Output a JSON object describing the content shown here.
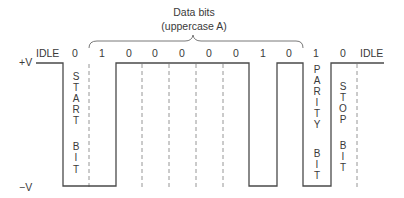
{
  "diagram": {
    "title": "Data bits",
    "subtitle": "(uppercase A)",
    "voltage_high_label": "+V",
    "voltage_low_label": "−V",
    "idle_left_label": "IDLE",
    "idle_right_label": "IDLE",
    "bit_values": [
      {
        "role": "start",
        "value": "0"
      },
      {
        "role": "data",
        "value": "1"
      },
      {
        "role": "data",
        "value": "0"
      },
      {
        "role": "data",
        "value": "0"
      },
      {
        "role": "data",
        "value": "0"
      },
      {
        "role": "data",
        "value": "0"
      },
      {
        "role": "data",
        "value": "0"
      },
      {
        "role": "data",
        "value": "1"
      },
      {
        "role": "data",
        "value": "0"
      },
      {
        "role": "parity",
        "value": "1"
      },
      {
        "role": "stop",
        "value": "0"
      }
    ],
    "start_bit_label": {
      "word1": [
        "S",
        "T",
        "A",
        "R",
        "T"
      ],
      "word2": [
        "B",
        "I",
        "T"
      ]
    },
    "parity_bit_label": {
      "word1": [
        "P",
        "A",
        "R",
        "I",
        "T",
        "Y"
      ],
      "word2": [
        "B",
        "I",
        "T"
      ]
    },
    "stop_bit_label": {
      "word1": [
        "S",
        "T",
        "O",
        "P"
      ],
      "word2": [
        "B",
        "I",
        "T"
      ]
    },
    "colors": {
      "line": "#4a4a4a",
      "dashed": "#8a8a8a",
      "text": "#3a3a3a",
      "background": "#ffffff"
    }
  }
}
